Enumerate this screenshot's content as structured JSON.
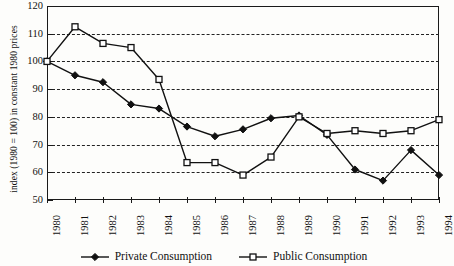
{
  "chart_data": {
    "type": "line",
    "title": "",
    "xlabel": "",
    "ylabel": "index (1980 = 100) in constant 1980 prices",
    "ylim": [
      50,
      120
    ],
    "ytick_step": 10,
    "yticks": [
      50,
      60,
      70,
      80,
      90,
      100,
      110,
      120
    ],
    "grid": true,
    "grid_style": "dashed horizontal",
    "legend_position": "bottom-center",
    "categories": [
      "1980",
      "1981",
      "1982",
      "1983",
      "1984",
      "1985",
      "1986",
      "1987",
      "1988",
      "1989",
      "1990",
      "1991",
      "1992",
      "1993",
      "1994"
    ],
    "x": [
      "1980",
      "1981",
      "1982",
      "1983",
      "1984",
      "1985",
      "1986",
      "1987",
      "1988",
      "1989",
      "1990",
      "1991",
      "1992",
      "1993",
      "1994"
    ],
    "series": [
      {
        "name": "Private Consumption",
        "marker": "filled-diamond",
        "color": "#111111",
        "values": [
          100,
          95,
          92.5,
          84.5,
          83,
          76.5,
          73,
          75.5,
          79.5,
          80.5,
          73.5,
          61,
          57,
          68,
          59
        ]
      },
      {
        "name": "Public Consumption",
        "marker": "open-square",
        "color": "#111111",
        "values": [
          100,
          112.5,
          106.5,
          105,
          93.5,
          63.5,
          63.5,
          59,
          65.5,
          80,
          74,
          75,
          74,
          75,
          79
        ]
      }
    ]
  },
  "legend": {
    "entries": [
      {
        "label": "Private Consumption",
        "marker": "filled-diamond"
      },
      {
        "label": "Public Consumption",
        "marker": "open-square"
      }
    ]
  }
}
